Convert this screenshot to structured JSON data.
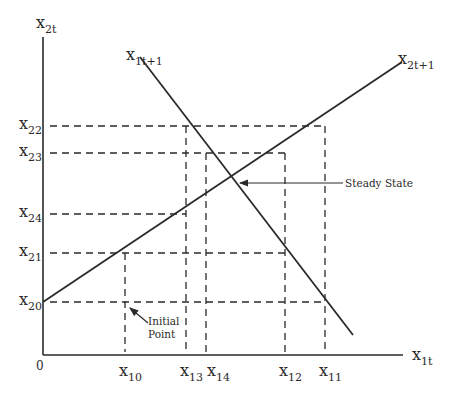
{
  "diagram": {
    "axes": {
      "y_label": {
        "main": "x",
        "sub": "2t"
      },
      "x_label": {
        "main": "x",
        "sub": "1t"
      },
      "origin": "0"
    },
    "curves": [
      {
        "name": "x2t+1",
        "label": {
          "main": "x",
          "sub": "2t+1"
        }
      },
      {
        "name": "x1t+1",
        "label": {
          "main": "x",
          "sub": "1t+1"
        }
      }
    ],
    "y_ticks": [
      {
        "main": "x",
        "sub": "22"
      },
      {
        "main": "x",
        "sub": "23"
      },
      {
        "main": "x",
        "sub": "24"
      },
      {
        "main": "x",
        "sub": "21"
      },
      {
        "main": "x",
        "sub": "20"
      }
    ],
    "x_ticks": [
      {
        "main": "x",
        "sub": "10"
      },
      {
        "main": "x",
        "sub": "13"
      },
      {
        "main": "x",
        "sub": "14"
      },
      {
        "main": "x",
        "sub": "12"
      },
      {
        "main": "x",
        "sub": "11"
      }
    ],
    "annotations": {
      "steady_state": "Steady State",
      "initial_point_line1": "Initial",
      "initial_point_line2": "Point"
    },
    "colors": {
      "ink": "#2a2a2a",
      "background": "#ffffff"
    }
  }
}
